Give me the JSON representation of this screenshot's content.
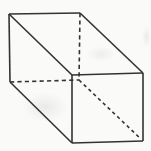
{
  "figure": {
    "name": "rectangular-prism-wireframe",
    "canvas": {
      "width": 151,
      "height": 151,
      "background_color": "#fafaf8"
    },
    "stroke": {
      "color": "#333333",
      "width": 1.6,
      "dash_pattern": "4.2 3.2",
      "diagonal_dash_pattern": "3.4 3.2"
    },
    "vertices": {
      "back_top_left": [
        9,
        14
      ],
      "back_top_right": [
        80,
        13
      ],
      "back_bottom_left": [
        10,
        82
      ],
      "back_bottom_right": [
        79,
        80
      ],
      "front_top_left": [
        72,
        75
      ],
      "front_top_right": [
        143,
        73
      ],
      "front_bottom_left": [
        72,
        143
      ],
      "front_bottom_right": [
        143,
        141
      ]
    },
    "edges": [
      {
        "name": "back-top-edge",
        "from": "back_top_left",
        "to": "back_top_right",
        "style": "solid"
      },
      {
        "name": "back-left-edge",
        "from": "back_top_left",
        "to": "back_bottom_left",
        "style": "solid"
      },
      {
        "name": "top-left-connector-edge",
        "from": "back_top_left",
        "to": "front_top_left",
        "style": "solid"
      },
      {
        "name": "top-right-connector-edge",
        "from": "back_top_right",
        "to": "front_top_right",
        "style": "solid"
      },
      {
        "name": "bottom-left-connector-edge",
        "from": "back_bottom_left",
        "to": "front_bottom_left",
        "style": "solid"
      },
      {
        "name": "front-top-edge",
        "from": "front_top_left",
        "to": "front_top_right",
        "style": "solid"
      },
      {
        "name": "front-left-edge",
        "from": "front_top_left",
        "to": "front_bottom_left",
        "style": "solid"
      },
      {
        "name": "front-right-edge",
        "from": "front_top_right",
        "to": "front_bottom_right",
        "style": "solid"
      },
      {
        "name": "front-bottom-edge",
        "from": "front_bottom_left",
        "to": "front_bottom_right",
        "style": "solid"
      },
      {
        "name": "back-right-hidden-edge",
        "from": "back_top_right",
        "to": "back_bottom_right",
        "style": "dashed"
      },
      {
        "name": "back-bottom-hidden-edge",
        "from": "back_bottom_left",
        "to": "back_bottom_right",
        "style": "dashed"
      },
      {
        "name": "bottom-right-hidden-connector-edge",
        "from": "back_bottom_right",
        "to": "front_bottom_right",
        "style": "dashed-diagonal",
        "end_inset": 4
      }
    ]
  }
}
